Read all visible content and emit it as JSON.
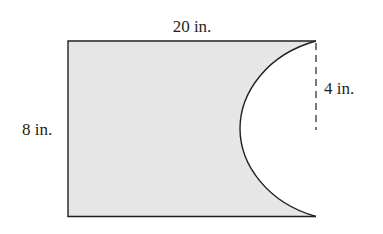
{
  "diagram": {
    "type": "geometry-figure",
    "shape": "rectangle with semicircular cutout on right side",
    "labels": {
      "width": "20 in.",
      "height": "8 in.",
      "radius": "4 in."
    },
    "colors": {
      "fill": "#e6e6e6",
      "stroke": "#231f20",
      "background": "#ffffff"
    }
  }
}
